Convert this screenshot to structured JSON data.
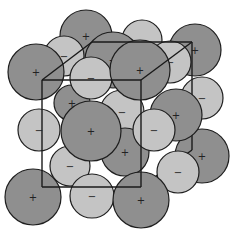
{
  "diagram": {
    "type": "ionic-crystal-lattice",
    "colors": {
      "cation_fill": "#8f8f8f",
      "anion_fill": "#c4c4c4",
      "outline": "#1e1e1e",
      "cube_line": "#1a1a1a",
      "background": "#ffffff"
    },
    "symbols": {
      "cation": "+",
      "anion": "−"
    },
    "spheres": [
      {
        "id": "b1",
        "layer": "back",
        "charge": "+",
        "cx": 86,
        "cy": 36,
        "r": 26
      },
      {
        "id": "b2",
        "layer": "back",
        "charge": "-",
        "cx": 142,
        "cy": 40,
        "r": 20
      },
      {
        "id": "b3",
        "layer": "back",
        "charge": "+",
        "cx": 195,
        "cy": 50,
        "r": 26
      },
      {
        "id": "b4",
        "layer": "back",
        "charge": "-",
        "cx": 202,
        "cy": 98,
        "r": 21
      },
      {
        "id": "b5",
        "layer": "back",
        "charge": "+",
        "cx": 202,
        "cy": 156,
        "r": 27
      },
      {
        "id": "b6",
        "layer": "back",
        "charge": "-",
        "cx": 64,
        "cy": 56,
        "r": 20
      },
      {
        "id": "m1",
        "layer": "middle",
        "charge": "+",
        "cx": 113,
        "cy": 60,
        "r": 28
      },
      {
        "id": "m2",
        "layer": "middle",
        "charge": "-",
        "cx": 170,
        "cy": 62,
        "r": 21
      },
      {
        "id": "m3",
        "layer": "middle",
        "charge": "+",
        "cx": 72,
        "cy": 103,
        "r": 18
      },
      {
        "id": "m4",
        "layer": "middle",
        "charge": "-",
        "cx": 122,
        "cy": 112,
        "r": 22
      },
      {
        "id": "m5",
        "layer": "middle",
        "charge": "+",
        "cx": 176,
        "cy": 115,
        "r": 26
      },
      {
        "id": "m6",
        "layer": "middle",
        "charge": "-",
        "cx": 70,
        "cy": 166,
        "r": 20
      },
      {
        "id": "m7",
        "layer": "middle",
        "charge": "+",
        "cx": 125,
        "cy": 152,
        "r": 24
      },
      {
        "id": "m8",
        "layer": "middle",
        "charge": "-",
        "cx": 178,
        "cy": 172,
        "r": 21
      },
      {
        "id": "f1",
        "layer": "front",
        "charge": "+",
        "cx": 36,
        "cy": 72,
        "r": 28
      },
      {
        "id": "f2",
        "layer": "front",
        "charge": "-",
        "cx": 91,
        "cy": 78,
        "r": 21
      },
      {
        "id": "f3",
        "layer": "front",
        "charge": "+",
        "cx": 140,
        "cy": 70,
        "r": 30
      },
      {
        "id": "f4",
        "layer": "front",
        "charge": "-",
        "cx": 39,
        "cy": 130,
        "r": 21
      },
      {
        "id": "f5",
        "layer": "front",
        "charge": "+",
        "cx": 91,
        "cy": 131,
        "r": 30
      },
      {
        "id": "f6",
        "layer": "front",
        "charge": "-",
        "cx": 154,
        "cy": 130,
        "r": 21
      },
      {
        "id": "f7",
        "layer": "front",
        "charge": "+",
        "cx": 33,
        "cy": 197,
        "r": 28
      },
      {
        "id": "f8",
        "layer": "front",
        "charge": "-",
        "cx": 92,
        "cy": 196,
        "r": 22
      },
      {
        "id": "f9",
        "layer": "front",
        "charge": "+",
        "cx": 141,
        "cy": 200,
        "r": 28
      }
    ],
    "cube": {
      "front": {
        "x1": 42,
        "y1": 80,
        "x2": 141,
        "y2": 187
      },
      "back": {
        "x1": 92,
        "y1": 42,
        "x2": 192,
        "y2": 150
      }
    }
  }
}
